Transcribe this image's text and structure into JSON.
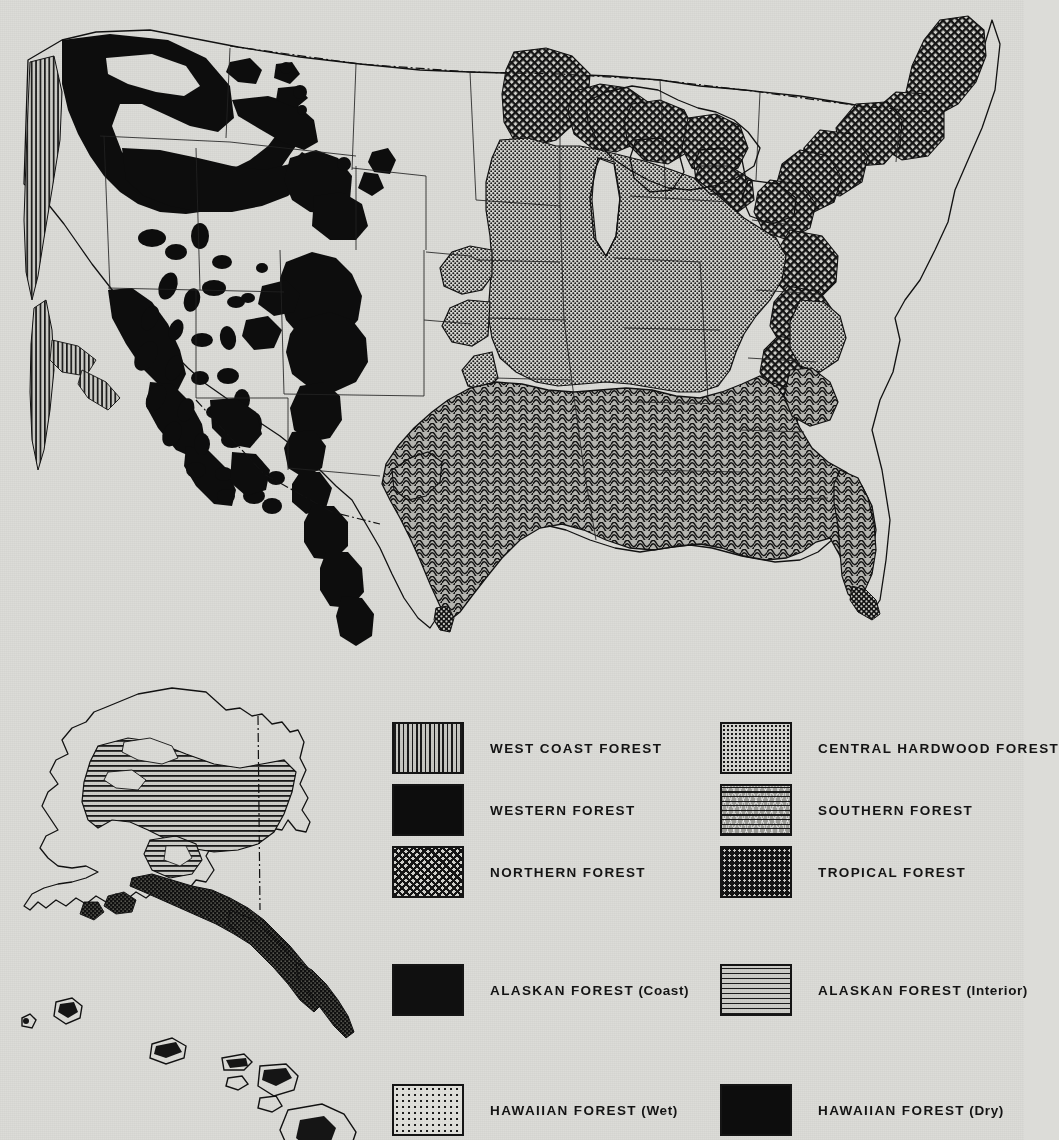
{
  "map": {
    "title_shown": false,
    "regions": [
      {
        "name": "west-coast-forest",
        "pattern": "vertical-stripes",
        "area": "Pacific Coast strip from Washington through California"
      },
      {
        "name": "western-forest",
        "pattern": "solid-black",
        "area": "Rocky Mountains, Cascades, Sierra Nevada, Great Basin ranges"
      },
      {
        "name": "northern-forest",
        "pattern": "crosshatch",
        "area": "Northern Minnesota, Wisconsin, Michigan, New England, Appalachians"
      },
      {
        "name": "central-hardwood-forest",
        "pattern": "fine-stipple",
        "area": "Ohio Valley, Missouri, Kentucky, Mid-Atlantic"
      },
      {
        "name": "southern-forest",
        "pattern": "wavy-lines",
        "area": "Gulf and South Atlantic Coastal Plain, Piedmont"
      },
      {
        "name": "tropical-forest",
        "pattern": "dark-dotted",
        "area": "Southern tip of Florida, southern Texas coast"
      },
      {
        "name": "alaskan-forest-coast",
        "pattern": "dark-dotted",
        "area": "Southeast Alaska panhandle and Gulf coast"
      },
      {
        "name": "alaskan-forest-interior",
        "pattern": "horizontal-lines",
        "area": "Interior Alaska basin"
      },
      {
        "name": "hawaiian-forest-wet",
        "pattern": "sparse-dots",
        "area": "Windward Hawaiian slopes"
      },
      {
        "name": "hawaiian-forest-dry",
        "pattern": "solid-black",
        "area": "Leeward Hawaiian slopes"
      }
    ]
  },
  "legend": {
    "items": [
      {
        "id": "west-coast-forest",
        "label": "WEST COAST FOREST",
        "pattern": "p-vert",
        "column": "left",
        "row": 0
      },
      {
        "id": "western-forest",
        "label": "WESTERN FOREST",
        "pattern": "p-solid",
        "column": "left",
        "row": 1
      },
      {
        "id": "northern-forest",
        "label": "NORTHERN FOREST",
        "pattern": "p-cross",
        "column": "left",
        "row": 2
      },
      {
        "id": "central-hardwood-forest",
        "label": "CENTRAL HARDWOOD FOREST",
        "pattern": "p-stipple",
        "column": "right",
        "row": 0
      },
      {
        "id": "southern-forest",
        "label": "SOUTHERN FOREST",
        "pattern": "p-wave",
        "column": "right",
        "row": 1
      },
      {
        "id": "tropical-forest",
        "label": "TROPICAL FOREST",
        "pattern": "p-tropical",
        "column": "right",
        "row": 2
      },
      {
        "id": "alaskan-forest-coast",
        "label": "ALASKAN FOREST (Coast)",
        "pattern": "p-akcoast",
        "column": "left",
        "row": 3
      },
      {
        "id": "alaskan-forest-interior",
        "label": "ALASKAN FOREST (Interior)",
        "pattern": "p-horz",
        "column": "right",
        "row": 3
      },
      {
        "id": "hawaiian-forest-wet",
        "label": "HAWAIIAN FOREST (Wet)",
        "pattern": "p-wetdot",
        "column": "left",
        "row": 4
      },
      {
        "id": "hawaiian-forest-dry",
        "label": "HAWAIIAN FOREST (Dry)",
        "pattern": "p-solid",
        "column": "right",
        "row": 4
      }
    ]
  },
  "colors": {
    "paper": "#dcdcd8",
    "ink": "#111111",
    "solid_fill": "#0d0d0d",
    "light_pattern": "#d6d6d1",
    "mid_pattern": "#9e9e99"
  }
}
